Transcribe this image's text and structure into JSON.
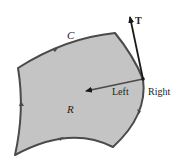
{
  "diagram": {
    "labels": {
      "curve": "C",
      "region": "R",
      "tangent": "T",
      "left_side": "Left",
      "right_side": "Right"
    },
    "colors": {
      "region_fill": "#c4c4c4",
      "boundary_stroke": "#4a4a4a",
      "arrow": "#1a1a1a"
    },
    "orientation": "counterclockwise"
  }
}
